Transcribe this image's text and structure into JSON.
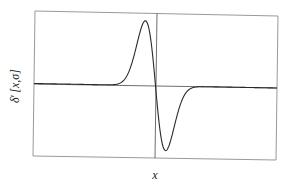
{
  "chart_data": {
    "type": "line",
    "title": "",
    "xlabel": "x",
    "ylabel": "δ ′[x,σ]",
    "function": "derivative of Gaussian: -x/(σ^3·sqrt(2π))·exp(-x^2/(2σ^2))",
    "sigma": 1,
    "xlim": [
      -11,
      11
    ],
    "ylim": [
      -0.27,
      0.27
    ],
    "grid": false,
    "legend": null,
    "ticks": {
      "x": [],
      "y": []
    },
    "axes_origin": [
      0,
      0
    ],
    "series": [
      {
        "name": "δ ′[x,σ]",
        "x": [
          -11,
          -6,
          -4,
          -3.5,
          -3,
          -2.5,
          -2,
          -1.5,
          -1,
          -0.5,
          0,
          0.5,
          1,
          1.5,
          2,
          2.5,
          3,
          3.5,
          4,
          6,
          11
        ],
        "values": [
          0,
          0,
          0.001,
          0.003,
          0.013,
          0.044,
          0.108,
          0.194,
          0.242,
          0.176,
          0,
          -0.176,
          -0.242,
          -0.194,
          -0.108,
          -0.044,
          -0.013,
          -0.003,
          -0.001,
          0,
          0
        ]
      }
    ],
    "key_points": {
      "maximum": {
        "x": -1,
        "y": 0.242
      },
      "minimum": {
        "x": 1,
        "y": -0.242
      },
      "zero_crossing": {
        "x": 0,
        "y": 0
      }
    }
  },
  "labels": {
    "x_axis": "x",
    "y_axis_delta": "δ",
    "y_axis_prime": "′",
    "y_axis_args": "[x,σ]"
  }
}
